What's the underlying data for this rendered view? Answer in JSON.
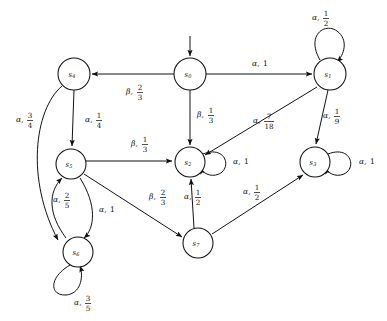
{
  "diagram": {
    "type": "finite-state-markov-chain",
    "title": "",
    "alphabet": [
      "alpha",
      "beta"
    ],
    "symbol_glyphs": {
      "alpha": "α",
      "beta": "β"
    },
    "start_state": "s0",
    "start_marker": "incoming-arrow-from-top",
    "states": [
      {
        "id": "s0",
        "label": "s",
        "subscript": "0",
        "cx": 190,
        "cy": 74,
        "r": 16
      },
      {
        "id": "s1",
        "label": "s",
        "subscript": "1",
        "cx": 330,
        "cy": 74,
        "r": 16
      },
      {
        "id": "s2",
        "label": "s",
        "subscript": "2",
        "cx": 190,
        "cy": 162,
        "r": 15
      },
      {
        "id": "s3",
        "label": "s",
        "subscript": "3",
        "cx": 315,
        "cy": 162,
        "r": 15
      },
      {
        "id": "s4",
        "label": "s",
        "subscript": "4",
        "cx": 74,
        "cy": 74,
        "r": 16
      },
      {
        "id": "s5",
        "label": "s",
        "subscript": "5",
        "cx": 71,
        "cy": 164,
        "r": 15
      },
      {
        "id": "s6",
        "label": "s",
        "subscript": "6",
        "cx": 78,
        "cy": 252,
        "r": 15
      },
      {
        "id": "s7",
        "label": "s",
        "subscript": "7",
        "cx": 198,
        "cy": 243,
        "r": 15
      }
    ],
    "transitions": [
      {
        "from": "s0",
        "to": "s4",
        "symbol": "β",
        "prob_num": "2",
        "prob_den": "3",
        "label_x": 126,
        "label_y": 92
      },
      {
        "from": "s0",
        "to": "s1",
        "symbol": "α",
        "prob_whole": "1",
        "label_x": 252,
        "label_y": 64
      },
      {
        "from": "s0",
        "to": "s2",
        "symbol": "β",
        "prob_num": "1",
        "prob_den": "3",
        "label_x": 197,
        "label_y": 115
      },
      {
        "from": "s1",
        "to": "s1",
        "symbol": "α",
        "prob_num": "1",
        "prob_den": "2",
        "label_x": 312,
        "label_y": 18,
        "self_loop": true
      },
      {
        "from": "s1",
        "to": "s2",
        "symbol": "α",
        "prob_num": "7",
        "prob_den": "18",
        "label_x": 253,
        "label_y": 121
      },
      {
        "from": "s1",
        "to": "s3",
        "symbol": "α",
        "prob_num": "1",
        "prob_den": "9",
        "label_x": 323,
        "label_y": 116
      },
      {
        "from": "s2",
        "to": "s2",
        "symbol": "α",
        "prob_whole": "1",
        "label_x": 233,
        "label_y": 162,
        "self_loop": true
      },
      {
        "from": "s3",
        "to": "s3",
        "symbol": "α",
        "prob_whole": "1",
        "label_x": 359,
        "label_y": 162,
        "self_loop": true
      },
      {
        "from": "s4",
        "to": "s5",
        "symbol": "α",
        "prob_num": "1",
        "prob_den": "4",
        "label_x": 85,
        "label_y": 120
      },
      {
        "from": "s4",
        "to": "s6",
        "symbol": "α",
        "prob_num": "3",
        "prob_den": "4",
        "label_x": 16,
        "label_y": 120
      },
      {
        "from": "s5",
        "to": "s2",
        "symbol": "β",
        "prob_num": "1",
        "prob_den": "3",
        "label_x": 131,
        "label_y": 144
      },
      {
        "from": "s5",
        "to": "s6",
        "symbol": "α",
        "prob_whole": "1",
        "label_x": 99,
        "label_y": 210
      },
      {
        "from": "s5",
        "to": "s7",
        "symbol": "β",
        "prob_num": "2",
        "prob_den": "3",
        "label_x": 149,
        "label_y": 197
      },
      {
        "from": "s6",
        "to": "s5",
        "symbol": "α",
        "prob_num": "2",
        "prob_den": "5",
        "label_x": 53,
        "label_y": 200
      },
      {
        "from": "s6",
        "to": "s6",
        "symbol": "α",
        "prob_num": "3",
        "prob_den": "5",
        "label_x": 74,
        "label_y": 303,
        "self_loop": true
      },
      {
        "from": "s7",
        "to": "s2",
        "symbol": "α",
        "prob_num": "1",
        "prob_den": "2",
        "label_x": 184,
        "label_y": 197
      },
      {
        "from": "s7",
        "to": "s3",
        "symbol": "α",
        "prob_num": "1",
        "prob_den": "2",
        "label_x": 243,
        "label_y": 192
      }
    ]
  }
}
